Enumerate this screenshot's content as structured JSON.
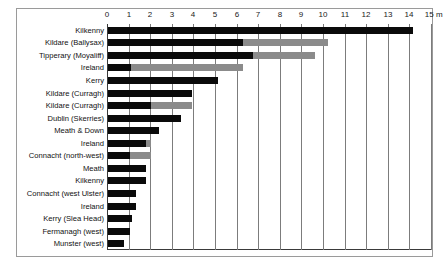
{
  "chart_data": {
    "type": "bar",
    "orientation": "horizontal",
    "stacked": true,
    "title": "",
    "xlabel": "m",
    "ylabel": "",
    "xlim": [
      0,
      15
    ],
    "grid": true,
    "legend": "none",
    "axis_unit": "m",
    "tick_labels": [
      "0",
      "1",
      "2",
      "3",
      "4",
      "5",
      "6",
      "7",
      "8",
      "9",
      "10",
      "11",
      "12",
      "13",
      "14",
      "15 m"
    ],
    "tick_values": [
      0,
      1,
      2,
      3,
      4,
      5,
      6,
      7,
      8,
      9,
      10,
      11,
      12,
      13,
      14,
      15
    ],
    "categories": [
      "Kilkenny",
      "Kildare (Ballysax)",
      "Tipperary (Moyaliff)",
      "Ireland",
      "Kerry",
      "Kildare (Curragh)",
      "Kildare (Curragh)",
      "Dublin (Skerries)",
      "Meath & Down",
      "Ireland",
      "Connacht (north-west)",
      "Meath",
      "Kilkenny",
      "Connacht (west Ulster)",
      "Ireland",
      "Kerry (Slea Head)",
      "Fermanagh (west)",
      "Munster (west)"
    ],
    "series": [
      {
        "name": "primary",
        "color": "#0a0a0a",
        "values": [
          14.1,
          6.25,
          6.7,
          1.05,
          5.1,
          3.9,
          2.0,
          3.4,
          2.35,
          1.75,
          1.0,
          1.75,
          1.75,
          1.3,
          1.3,
          1.1,
          1.0,
          0.75
        ]
      },
      {
        "name": "secondary",
        "color": "#8b8b8b",
        "values": [
          0,
          3.95,
          2.9,
          5.2,
          0,
          0,
          1.9,
          0,
          0,
          0.25,
          1.0,
          0,
          0,
          0,
          0,
          0,
          0,
          0
        ]
      }
    ],
    "totals": [
      14.1,
      10.2,
      9.6,
      6.25,
      5.1,
      3.9,
      3.9,
      3.4,
      2.35,
      2.0,
      2.0,
      1.75,
      1.75,
      1.3,
      1.3,
      1.1,
      1.0,
      0.75
    ]
  }
}
